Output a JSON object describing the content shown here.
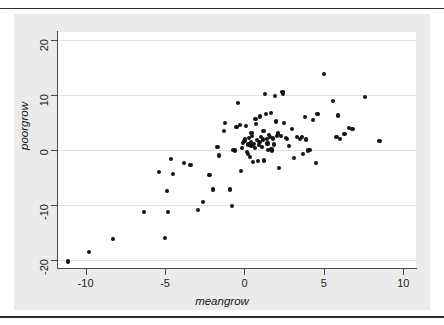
{
  "chart_data": {
    "type": "scatter",
    "title": "",
    "xlabel": "meangrow",
    "ylabel": "poorgrow",
    "xlim": [
      -11.8,
      10.8
    ],
    "ylim": [
      -21.5,
      21.5
    ],
    "xticks": [
      -10,
      -5,
      0,
      5,
      10
    ],
    "xticklabels": [
      "-10",
      "-5",
      "0",
      "5",
      "10"
    ],
    "yticks": [
      20,
      10,
      0,
      -10,
      -20
    ],
    "yticklabels": [
      "20",
      "10",
      "0",
      "-10",
      "-20"
    ],
    "grid": "horizontal",
    "legend": "none",
    "marker": "filled-circle",
    "marker_color": "#141414",
    "background_color": "#ebebeb",
    "plot_background_color": "#ffffff",
    "gridline_color": "#e2e2e2",
    "axis_color": "#4a4a46",
    "n_points": 104,
    "points": [
      [
        -11.1,
        -20.3
      ],
      [
        -9.8,
        -18.6
      ],
      [
        -8.3,
        -16.2
      ],
      [
        -6.3,
        -11.3
      ],
      [
        -5.4,
        -4.0
      ],
      [
        -5.0,
        -16.1
      ],
      [
        -4.9,
        -7.4
      ],
      [
        -4.8,
        -11.3
      ],
      [
        -4.6,
        -1.6
      ],
      [
        -4.5,
        -4.3
      ],
      [
        -3.8,
        -2.4
      ],
      [
        -3.4,
        -2.8
      ],
      [
        -2.9,
        -11.0
      ],
      [
        -2.6,
        -9.5
      ],
      [
        -2.2,
        -4.6
      ],
      [
        -2.0,
        -7.2
      ],
      [
        -1.7,
        0.5
      ],
      [
        -1.6,
        -1.0
      ],
      [
        -1.3,
        3.4
      ],
      [
        -1.2,
        4.9
      ],
      [
        -0.9,
        -7.2
      ],
      [
        -0.8,
        -10.2
      ],
      [
        -0.7,
        0.0
      ],
      [
        -0.6,
        -0.1
      ],
      [
        -0.5,
        4.2
      ],
      [
        -0.4,
        8.6
      ],
      [
        -0.3,
        4.6
      ],
      [
        -0.2,
        -3.9
      ],
      [
        -0.15,
        0.3
      ],
      [
        -0.1,
        1.3
      ],
      [
        0.0,
        1.6
      ],
      [
        0.05,
        2.0
      ],
      [
        0.1,
        4.4
      ],
      [
        0.15,
        -0.4
      ],
      [
        0.2,
        -0.8
      ],
      [
        0.25,
        1.0
      ],
      [
        0.3,
        2.2
      ],
      [
        0.35,
        -1.3
      ],
      [
        0.4,
        1.5
      ],
      [
        0.45,
        0.7
      ],
      [
        0.5,
        2.6
      ],
      [
        0.55,
        -2.2
      ],
      [
        0.6,
        1.1
      ],
      [
        0.65,
        0.3
      ],
      [
        0.7,
        5.6
      ],
      [
        0.75,
        4.7
      ],
      [
        0.8,
        1.8
      ],
      [
        0.85,
        -2.0
      ],
      [
        0.9,
        0.9
      ],
      [
        0.95,
        1.4
      ],
      [
        1.0,
        6.1
      ],
      [
        1.05,
        2.4
      ],
      [
        1.1,
        0.6
      ],
      [
        1.15,
        1.9
      ],
      [
        1.2,
        3.4
      ],
      [
        1.25,
        -1.9
      ],
      [
        1.3,
        10.2
      ],
      [
        1.35,
        6.5
      ],
      [
        1.4,
        2.0
      ],
      [
        1.45,
        1.2
      ],
      [
        1.5,
        0.0
      ],
      [
        1.55,
        2.8
      ],
      [
        1.6,
        2.3
      ],
      [
        1.65,
        6.8
      ],
      [
        1.7,
        0.1
      ],
      [
        1.75,
        -0.2
      ],
      [
        1.8,
        2.1
      ],
      [
        1.85,
        1.0
      ],
      [
        1.9,
        9.8
      ],
      [
        2.0,
        5.2
      ],
      [
        2.05,
        2.6
      ],
      [
        2.1,
        3.0
      ],
      [
        2.2,
        -3.3
      ],
      [
        2.3,
        2.5
      ],
      [
        2.4,
        10.5
      ],
      [
        2.45,
        10.2
      ],
      [
        2.5,
        4.9
      ],
      [
        2.6,
        2.2
      ],
      [
        2.7,
        2.0
      ],
      [
        2.8,
        0.8
      ],
      [
        3.0,
        3.8
      ],
      [
        3.1,
        -1.5
      ],
      [
        3.3,
        2.3
      ],
      [
        3.5,
        2.0
      ],
      [
        3.6,
        2.4
      ],
      [
        3.7,
        -0.7
      ],
      [
        3.8,
        6.0
      ],
      [
        3.9,
        1.9
      ],
      [
        4.0,
        -0.1
      ],
      [
        4.1,
        0.0
      ],
      [
        4.3,
        5.5
      ],
      [
        4.5,
        -2.3
      ],
      [
        4.6,
        6.5
      ],
      [
        5.0,
        13.9
      ],
      [
        5.6,
        8.9
      ],
      [
        5.8,
        2.3
      ],
      [
        5.9,
        6.3
      ],
      [
        6.0,
        2.0
      ],
      [
        6.3,
        2.9
      ],
      [
        6.6,
        4.0
      ],
      [
        6.8,
        3.9
      ],
      [
        7.6,
        9.6
      ],
      [
        8.5,
        1.6
      ],
      [
        0.45,
        3.1
      ]
    ]
  },
  "figure": {
    "x_axis_title": "meangrow",
    "y_axis_title": "poorgrow"
  }
}
